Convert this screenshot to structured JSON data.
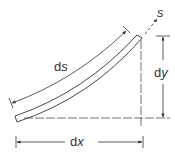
{
  "diagram": {
    "labels": {
      "ds_d": "d",
      "ds_s": "s",
      "s": "s",
      "dy_d": "d",
      "dy_y": "y",
      "dx_d": "d",
      "dx_x": "x"
    },
    "colors": {
      "stroke": "#333333",
      "background": "#ffffff"
    }
  }
}
